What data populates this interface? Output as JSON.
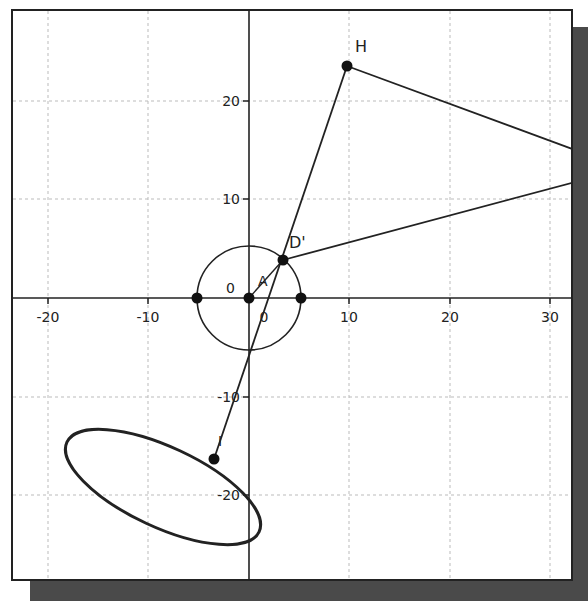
{
  "canvas": {
    "x_ticks": [
      {
        "value": -20,
        "label": "-20",
        "px": 48
      },
      {
        "value": -10,
        "label": "-10",
        "px": 148
      },
      {
        "value": 10,
        "label": "10",
        "px": 349
      },
      {
        "value": 20,
        "label": "20",
        "px": 450
      },
      {
        "value": 30,
        "label": "30",
        "px": 550
      }
    ],
    "y_ticks": [
      {
        "value": 20,
        "label": "20",
        "py": 101
      },
      {
        "value": 10,
        "label": "10",
        "py": 199
      },
      {
        "value": -10,
        "label": "-10",
        "py": 397
      },
      {
        "value": -20,
        "label": "-20",
        "py": 495
      }
    ],
    "origin_labels": {
      "y_zero": "0",
      "x_zero": "0"
    },
    "points": {
      "H": {
        "label": "H",
        "x": 9.8,
        "y": 23.5
      },
      "D_prime": {
        "label": "D'",
        "x": 3.4,
        "y": 3.9
      },
      "A": {
        "label": "A",
        "x": 0,
        "y": 0
      },
      "I": {
        "label": "I",
        "x": -3.5,
        "y": -16.3
      },
      "circle_left": {
        "label": "",
        "x": -5.2,
        "y": 0
      },
      "circle_right": {
        "label": "",
        "x": 5.2,
        "y": 0
      }
    },
    "circle": {
      "center": [
        0,
        0
      ],
      "radius": 5.2
    },
    "ellipse": {
      "center": [
        -8.6,
        -19.2
      ],
      "rx": 10.5,
      "ry": 4.0,
      "rotation_deg": 25
    },
    "colors": {
      "axis": "#222222",
      "grid": "#bbbbbb",
      "stroke": "#222222",
      "shadow": "#4a4a4a"
    }
  }
}
